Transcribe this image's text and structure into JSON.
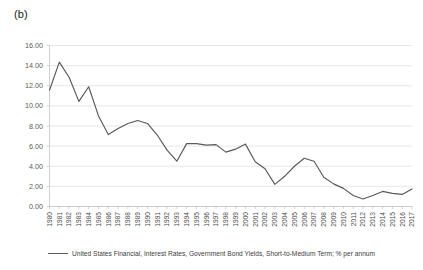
{
  "figure": {
    "panel_label": "(b)"
  },
  "legend": {
    "position": "bottom",
    "entries": [
      {
        "label": "United States Financial, Interest Rates, Government Bond Yields, Short-to-Medium Term; % per annum",
        "color": "#595959"
      }
    ]
  },
  "chart_data": {
    "type": "line",
    "title": "(b)",
    "xlabel": "",
    "ylabel": "",
    "grid": true,
    "legend_position": "bottom",
    "line_color": "#595959",
    "ylim": [
      0.0,
      16.0
    ],
    "ytick_step": 2.0,
    "ytick_labels": [
      "0.00",
      "2.00",
      "4.00",
      "6.00",
      "8.00",
      "10.00",
      "12.00",
      "14.00",
      "16.00"
    ],
    "ytick_values": [
      0.0,
      2.0,
      4.0,
      6.0,
      8.0,
      10.0,
      12.0,
      14.0,
      16.0
    ],
    "categories": [
      "1980",
      "1981",
      "1982",
      "1983",
      "1984",
      "1985",
      "1986",
      "1987",
      "1988",
      "1989",
      "1990",
      "1991",
      "1992",
      "1993",
      "1994",
      "1995",
      "1996",
      "1997",
      "1998",
      "1999",
      "2000",
      "2001",
      "2002",
      "2003",
      "2004",
      "2005",
      "2006",
      "2007",
      "2008",
      "2009",
      "2010",
      "2011",
      "2012",
      "2013",
      "2014",
      "2015",
      "2016",
      "2017"
    ],
    "series": [
      {
        "name": "United States Financial, Interest Rates, Government Bond Yields, Short-to-Medium Term; % per annum",
        "color": "#595959",
        "values": [
          11.55,
          14.35,
          12.85,
          10.45,
          11.9,
          9.0,
          7.15,
          7.75,
          8.25,
          8.55,
          8.25,
          7.1,
          5.6,
          4.5,
          6.25,
          6.25,
          6.1,
          6.15,
          5.4,
          5.7,
          6.2,
          4.45,
          3.75,
          2.2,
          3.0,
          4.0,
          4.8,
          4.5,
          2.9,
          2.25,
          1.8,
          1.1,
          0.75,
          1.1,
          1.5,
          1.3,
          1.2,
          1.75
        ]
      }
    ]
  }
}
